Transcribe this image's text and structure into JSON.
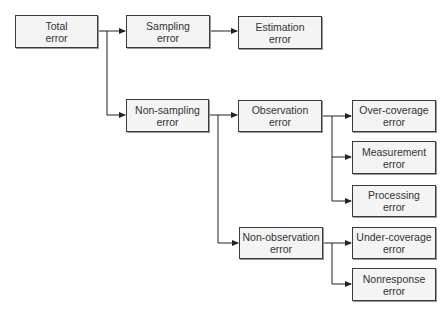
{
  "diagram": {
    "nodes": [
      {
        "id": "total",
        "line1": "Total",
        "line2": "error",
        "x": 15,
        "y": 15,
        "w": 83,
        "h": 33
      },
      {
        "id": "sampling",
        "line1": "Sampling",
        "line2": "error",
        "x": 126,
        "y": 15,
        "w": 84,
        "h": 33
      },
      {
        "id": "estimation",
        "line1": "Estimation",
        "line2": "error",
        "x": 238,
        "y": 16,
        "w": 84,
        "h": 33
      },
      {
        "id": "non-sampling",
        "line1": "Non-sampling",
        "line2": "error",
        "x": 126,
        "y": 99,
        "w": 83,
        "h": 33
      },
      {
        "id": "observation",
        "line1": "Observation",
        "line2": "error",
        "x": 238,
        "y": 100,
        "w": 84,
        "h": 32
      },
      {
        "id": "over-coverage",
        "line1": "Over-coverage",
        "line2": "error",
        "x": 352,
        "y": 100,
        "w": 84,
        "h": 32
      },
      {
        "id": "measurement",
        "line1": "Measurement",
        "line2": "error",
        "x": 352,
        "y": 141,
        "w": 84,
        "h": 33
      },
      {
        "id": "processing",
        "line1": "Processing",
        "line2": "error",
        "x": 352,
        "y": 185,
        "w": 84,
        "h": 32
      },
      {
        "id": "non-observation",
        "line1": "Non-observation",
        "line2": "error",
        "x": 239,
        "y": 227,
        "w": 84,
        "h": 32
      },
      {
        "id": "under-coverage",
        "line1": "Under-coverage",
        "line2": "error",
        "x": 352,
        "y": 227,
        "w": 84,
        "h": 32
      },
      {
        "id": "nonresponse",
        "line1": "Nonresponse",
        "line2": "error",
        "x": 352,
        "y": 268,
        "w": 84,
        "h": 33
      }
    ],
    "edges": [
      {
        "from": "total",
        "to": "sampling"
      },
      {
        "from": "total",
        "to": "non-sampling"
      },
      {
        "from": "sampling",
        "to": "estimation"
      },
      {
        "from": "non-sampling",
        "to": "observation"
      },
      {
        "from": "non-sampling",
        "to": "non-observation"
      },
      {
        "from": "observation",
        "to": "over-coverage"
      },
      {
        "from": "observation",
        "to": "measurement"
      },
      {
        "from": "observation",
        "to": "processing"
      },
      {
        "from": "non-observation",
        "to": "under-coverage"
      },
      {
        "from": "non-observation",
        "to": "nonresponse"
      }
    ],
    "colors": {
      "line": "#222222",
      "box_border": "#3a3a3a",
      "box_fill": "#f4f4f4",
      "text": "#333333"
    }
  }
}
